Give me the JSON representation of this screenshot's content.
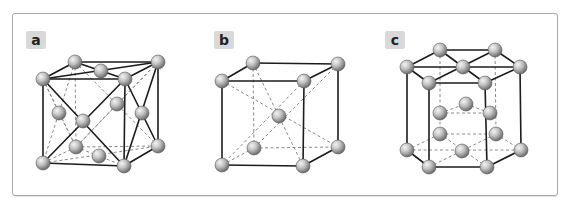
{
  "figure": {
    "panels": [
      {
        "label": "a",
        "structure": "face-centered cubic"
      },
      {
        "label": "b",
        "structure": "body-centered cubic"
      },
      {
        "label": "c",
        "structure": "hexagonal close-packed"
      }
    ]
  },
  "colors": {
    "frame_border": "#a8a8a8",
    "label_bg": "#d9d9d9",
    "solid_edge": "#1c1c1c",
    "dashed_edge": "#8a8a8a",
    "atom_light": "#f2f2f2",
    "atom_dark": "#6e6e6e"
  }
}
